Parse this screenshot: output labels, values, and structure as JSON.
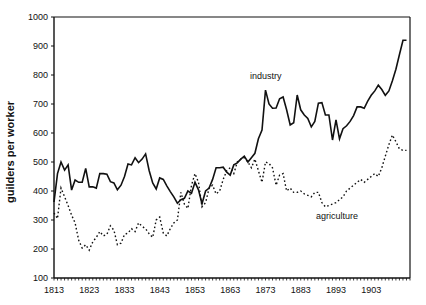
{
  "chart_data": {
    "type": "line",
    "title": "",
    "xlabel": "",
    "ylabel": "guilders per worker",
    "xlim": [
      1813,
      1914
    ],
    "ylim": [
      100,
      1000
    ],
    "yticks": [
      100,
      200,
      300,
      400,
      500,
      600,
      700,
      800,
      900,
      1000
    ],
    "xticks": [
      1813,
      1823,
      1833,
      1843,
      1853,
      1863,
      1873,
      1883,
      1893,
      1903
    ],
    "grid": false,
    "legend": "inline labels",
    "x": [
      1813,
      1814,
      1815,
      1816,
      1817,
      1818,
      1819,
      1820,
      1821,
      1822,
      1823,
      1824,
      1825,
      1826,
      1827,
      1828,
      1829,
      1830,
      1831,
      1832,
      1833,
      1834,
      1835,
      1836,
      1837,
      1838,
      1839,
      1840,
      1841,
      1842,
      1843,
      1844,
      1845,
      1846,
      1847,
      1848,
      1849,
      1850,
      1851,
      1852,
      1853,
      1854,
      1855,
      1856,
      1857,
      1858,
      1859,
      1860,
      1861,
      1862,
      1863,
      1864,
      1865,
      1866,
      1867,
      1868,
      1869,
      1870,
      1871,
      1872,
      1873,
      1874,
      1875,
      1876,
      1877,
      1878,
      1879,
      1880,
      1881,
      1882,
      1883,
      1884,
      1885,
      1886,
      1887,
      1888,
      1889,
      1890,
      1891,
      1892,
      1893,
      1894,
      1895,
      1896,
      1897,
      1898,
      1899,
      1900,
      1901,
      1902,
      1903,
      1904,
      1905,
      1906,
      1907,
      1908,
      1909,
      1910,
      1911,
      1912,
      1913
    ],
    "series": [
      {
        "name": "industry",
        "style": "solid",
        "values": [
          362,
          460,
          500,
          472,
          490,
          403,
          438,
          430,
          430,
          478,
          414,
          415,
          410,
          460,
          460,
          458,
          432,
          428,
          404,
          420,
          450,
          493,
          490,
          515,
          498,
          510,
          528,
          470,
          428,
          407,
          445,
          440,
          418,
          398,
          380,
          358,
          370,
          375,
          400,
          392,
          430,
          404,
          356,
          400,
          410,
          440,
          480,
          480,
          482,
          465,
          455,
          490,
          497,
          510,
          520,
          500,
          515,
          530,
          580,
          610,
          748,
          700,
          685,
          686,
          718,
          724,
          680,
          628,
          635,
          731,
          680,
          662,
          650,
          621,
          640,
          703,
          705,
          662,
          662,
          576,
          645,
          580,
          615,
          625,
          640,
          660,
          690,
          690,
          685,
          710,
          730,
          745,
          765,
          750,
          730,
          745,
          780,
          820,
          870,
          920,
          920
        ]
      },
      {
        "name": "agriculture",
        "style": "dotted",
        "values": [
          324,
          305,
          410,
          380,
          350,
          317,
          290,
          230,
          203,
          215,
          196,
          225,
          240,
          260,
          245,
          250,
          280,
          265,
          215,
          220,
          250,
          255,
          270,
          260,
          290,
          278,
          270,
          252,
          240,
          300,
          310,
          255,
          245,
          270,
          290,
          300,
          395,
          355,
          340,
          420,
          460,
          430,
          345,
          360,
          410,
          420,
          390,
          400,
          440,
          470,
          480,
          460,
          500,
          510,
          515,
          500,
          480,
          510,
          470,
          430,
          500,
          495,
          480,
          420,
          455,
          460,
          400,
          410,
          395,
          395,
          400,
          390,
          385,
          380,
          395,
          395,
          360,
          345,
          350,
          355,
          360,
          370,
          380,
          400,
          410,
          420,
          430,
          440,
          430,
          440,
          450,
          460,
          450,
          480,
          520,
          560,
          593,
          570,
          545,
          540,
          540
        ]
      }
    ],
    "annotations": [
      {
        "text": "industry",
        "x": 1870,
        "y": 785
      },
      {
        "text": "agriculture",
        "x": 1888,
        "y": 308
      }
    ]
  },
  "labels": {
    "y_axis_title": "guilders per worker",
    "industry": "industry",
    "agriculture": "agriculture",
    "yticks": [
      "100",
      "200",
      "300",
      "400",
      "500",
      "600",
      "700",
      "800",
      "900",
      "1000"
    ],
    "xticks": [
      "1813",
      "1823",
      "1833",
      "1843",
      "1853",
      "1863",
      "1873",
      "1883",
      "1893",
      "1903"
    ]
  }
}
